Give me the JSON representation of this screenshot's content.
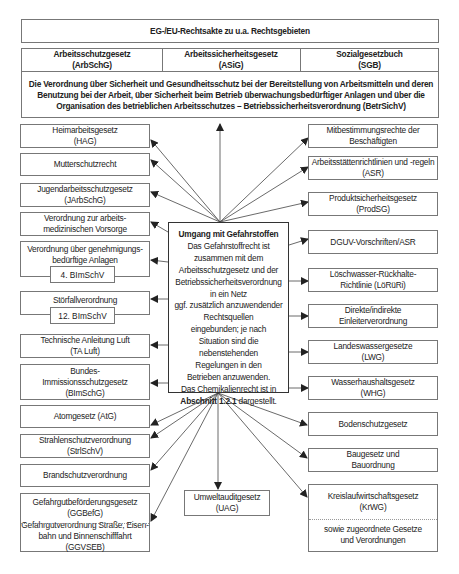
{
  "header": {
    "top": "EG-/EU-Rechtsakte zu u.a. Rechtsgebieten",
    "columns": [
      {
        "line1": "Arbeitsschutzgesetz",
        "line2": "(ArbSchG)"
      },
      {
        "line1": "Arbeitssicherheitsgesetz",
        "line2": "(ASiG)"
      },
      {
        "line1": "Sozialgesetzbuch",
        "line2": "(SGB)"
      }
    ],
    "betrsichv": "Die Verordnung über Sicherheit und Gesundheitsschutz bei der Bereitstellung von Arbeitsmitteln und deren Benutzung bei der Arbeit, über Sicherheit beim Betrieb überwachungsbedürftiger Anlagen und über die Organisation des betrieblichen Arbeitsschutzes – Betriebssicherheitsverordnung (BetrSichV)"
  },
  "center": {
    "title": "Umgang mit Gefahrstoffen",
    "lines": [
      "Das Gefahrstoffrecht ist",
      "zusammen mit dem",
      "Arbeitsschutzgesetz und der",
      "Betriebssicherheitsverordnung",
      "in ein Netz",
      "ggf. zusätzlich anzuwendender",
      "Rechtsquellen",
      "eingebunden; je nach",
      "Situation sind die",
      "nebenstehenden",
      "Regelungen in den",
      "Betrieben anzuwenden.",
      "Das Chemikalienrecht ist in"
    ],
    "ref_bold": "Abschnitt 1.2.1",
    "ref_rest": " dargestellt."
  },
  "left": [
    {
      "line1": "Heimarbeitsgesetz",
      "line2": "(HAG)"
    },
    {
      "line1": "Mutterschutzrecht",
      "line2": ""
    },
    {
      "line1": "Jugendarbeitsschutzgesetz",
      "line2": "(JArbSchG)"
    },
    {
      "line1": "Verordnung zur arbeits-",
      "line2": "medizinischen Vorsorge"
    },
    {
      "line1": "Verordnung über genehmigungs-",
      "line2": "bedürftige Anlagen",
      "sub": "4. BImSchV"
    },
    {
      "line1": "Störfallverordnung",
      "line2": "",
      "sub": "12. BImSchV"
    },
    {
      "line1": "Technische Anleitung Luft",
      "line2": "(TA Luft)"
    },
    {
      "line1": "Bundes-",
      "line2": "Immissionsschutzgesetz",
      "line3": "(BImSchG)"
    },
    {
      "line1": "Atomgesetz (AtG)",
      "line2": ""
    },
    {
      "line1": "Strahlenschutzverordnung",
      "line2": "(StrlSchV)"
    },
    {
      "line1": "Brandschutzverordnung",
      "line2": ""
    },
    {
      "line1": "Gefahrgutbeförderungsgesetz",
      "line2": "(GGBefG)",
      "part2_line1": "Gefahrgutverordnung Straße, Eisen-",
      "part2_line2": "bahn und Binnenschifffahrt (GGVSEB)"
    }
  ],
  "right": [
    {
      "line1": "Mitbestimmungsrechte der",
      "line2": "Beschäftigten"
    },
    {
      "line1": "Arbeitsstättenrichtlinien und -regeln",
      "line2": "(ASR)"
    },
    {
      "line1": "Produktsicherheitsgesetz",
      "line2": "(ProdSG)"
    },
    {
      "line1": "DGUV-Vorschriften/ASR",
      "line2": ""
    },
    {
      "line1": "Löschwasser-Rückhalte-",
      "line2": "Richtlinie (LöRüRi)"
    },
    {
      "line1": "Direkte/indirekte",
      "line2": "Einleiterverordnung"
    },
    {
      "line1": "Landeswassergesetze",
      "line2": "(LWG)"
    },
    {
      "line1": "Wasserhaushaltsgesetz",
      "line2": "(WHG)"
    },
    {
      "line1": "Bodenschutzgesetz",
      "line2": ""
    },
    {
      "line1": "Baugesetz und",
      "line2": "Bauordnung"
    },
    {
      "line1": "Kreislaufwirtschaftsgesetz",
      "line2": "(KrWG)",
      "part2_line1": "sowie zugeordnete Gesetze",
      "part2_line2": "und Verordnungen"
    }
  ],
  "bottom": {
    "line1": "Umweltauditgesetz",
    "line2": "(UAG)"
  },
  "colors": {
    "border": "#777777",
    "arrow": "#333333",
    "text": "#222222"
  }
}
